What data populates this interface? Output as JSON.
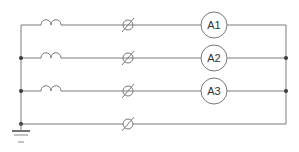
{
  "diagram": {
    "type": "electrical-schematic",
    "colors": {
      "wire": "#7a7a7a",
      "node": "#3a3a3a",
      "text": "#333333",
      "background": "#ffffff"
    },
    "branches": [
      {
        "index": 0,
        "components": [
          "inductor",
          "fuse",
          "ammeter"
        ],
        "ammeter_label": "A1"
      },
      {
        "index": 1,
        "components": [
          "inductor",
          "fuse",
          "ammeter"
        ],
        "ammeter_label": "A2"
      },
      {
        "index": 2,
        "components": [
          "inductor",
          "fuse",
          "ammeter"
        ],
        "ammeter_label": "A3"
      },
      {
        "index": 3,
        "components": [
          "fuse"
        ],
        "ammeter_label": null
      }
    ],
    "ground": {
      "symbol": "ground-icon",
      "position": "bottom-left"
    }
  }
}
